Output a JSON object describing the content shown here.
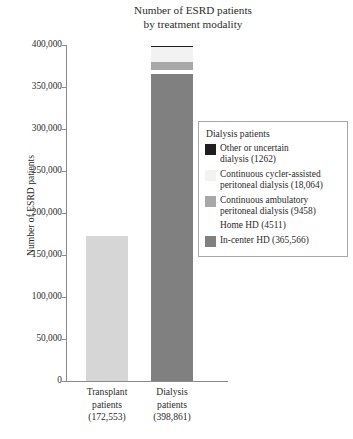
{
  "chart_data": {
    "type": "bar",
    "title": "Number of ESRD patients by treatment modality",
    "title_line1": "Number of ESRD patients",
    "title_line2": "by treatment modality",
    "xlabel": "",
    "ylabel": "Number of ESRD patients",
    "ylim": [
      0,
      400000
    ],
    "grid": false,
    "stacked": true,
    "legend_position": "right",
    "ytick_labels": [
      "400,000",
      "350,000",
      "300,000",
      "250,000",
      "200,000",
      "150,000",
      "100,000",
      "50,000",
      "0"
    ],
    "ytick_values": [
      400000,
      350000,
      300000,
      250000,
      200000,
      150000,
      100000,
      50000,
      0
    ],
    "categories": [
      "Transplant patients (172,553)",
      "Dialysis patients (398,861)"
    ],
    "category_labels": [
      {
        "line1": "Transplant",
        "line2": "patients",
        "line3": "(172,553)",
        "total": 172553
      },
      {
        "line1": "Dialysis",
        "line2": "patients",
        "line3": "(398,861)",
        "total": 398861
      }
    ],
    "series": [
      {
        "name": "Transplant patients",
        "values": [
          172553,
          0
        ],
        "color": "#d6d6d6"
      },
      {
        "name": "In-center HD",
        "values": [
          0,
          365566
        ],
        "color": "#808080"
      },
      {
        "name": "Home HD",
        "values": [
          0,
          4511
        ],
        "color": "#ffffff"
      },
      {
        "name": "Continuous ambulatory peritoneal dialysis",
        "values": [
          0,
          9458
        ],
        "color": "#a8a8a8"
      },
      {
        "name": "Continuous cycler-assisted peritoneal dialysis",
        "values": [
          0,
          18064
        ],
        "color": "#f2f2f2"
      },
      {
        "name": "Other or uncertain dialysis",
        "values": [
          0,
          1262
        ],
        "color": "#1e1e1e"
      }
    ]
  },
  "title": {
    "line1": "Number of ESRD patients",
    "line2": "by treatment modality"
  },
  "axes": {
    "y_label": "Number of ESRD patients",
    "y_ticks": [
      {
        "label": "400,000",
        "value": 400000
      },
      {
        "label": "350,000",
        "value": 350000
      },
      {
        "label": "300,000",
        "value": 300000
      },
      {
        "label": "250,000",
        "value": 250000
      },
      {
        "label": "200,000",
        "value": 200000
      },
      {
        "label": "150,000",
        "value": 150000
      },
      {
        "label": "100,000",
        "value": 100000
      },
      {
        "label": "50,000",
        "value": 50000
      },
      {
        "label": "0",
        "value": 0
      }
    ],
    "x_categories": [
      {
        "line1": "Transplant",
        "line2": "patients",
        "line3": "(172,553)"
      },
      {
        "line1": "Dialysis",
        "line2": "patients",
        "line3": "(398,861)"
      }
    ]
  },
  "legend": {
    "title": "Dialysis patients",
    "items": [
      {
        "label_line1": "Other or uncertain",
        "label_line2": "dialysis (1262)",
        "swatch": "#1e1e1e",
        "value": 1262,
        "has_border": false
      },
      {
        "label_line1": "Continuous cycler-assisted",
        "label_line2": "peritoneal dialysis (18,064)",
        "swatch": "#f2f2f2",
        "value": 18064,
        "has_border": false
      },
      {
        "label_line1": "Continuous ambulatory",
        "label_line2": "peritoneal dialysis (9458)",
        "swatch": "#a8a8a8",
        "value": 9458,
        "has_border": false
      },
      {
        "label_line1": "Home HD (4511)",
        "label_line2": "",
        "swatch": "#ffffff",
        "value": 4511,
        "has_border": false
      },
      {
        "label_line1": "In-center HD (365,566)",
        "label_line2": "",
        "swatch": "#808080",
        "value": 365566,
        "has_border": false
      }
    ]
  },
  "colors": {
    "axis": "#8a8a8a",
    "text": "#2b2b2b",
    "legend_border": "#a8a8a8",
    "transplant_bar": "#d6d6d6",
    "in_center_hd": "#808080",
    "home_hd": "#ffffff",
    "capd": "#a8a8a8",
    "ccpd": "#f2f2f2",
    "other": "#1e1e1e"
  }
}
